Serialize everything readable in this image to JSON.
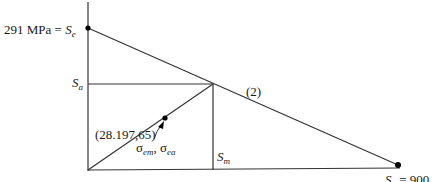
{
  "diagram": {
    "type": "goodman-diagram",
    "labels": {
      "se_value": "291 MPa = ",
      "se_symbol": "S",
      "se_sub": "e",
      "sa_symbol": "S",
      "sa_sub": "a",
      "sm_symbol": "S",
      "sm_sub": "m",
      "line_tag": "(2)",
      "point_coords": "(28.197,65)",
      "sigma_em": "σ",
      "sigma_em_sub": "em",
      "sigma_sep": ", ",
      "sigma_ea": "σ",
      "sigma_ea_sub": "ea",
      "su_label": "S",
      "su_sub": "u",
      "su_value": " = 900"
    },
    "colors": {
      "line": "#333333",
      "point": "#000000"
    }
  }
}
